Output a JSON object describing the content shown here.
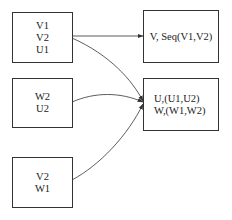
{
  "diagram": {
    "nodes": [
      {
        "id": "a",
        "lines": [
          "V1",
          "V2",
          "U1"
        ]
      },
      {
        "id": "b",
        "lines": [
          "W2",
          "U2"
        ]
      },
      {
        "id": "c",
        "lines": [
          "V2",
          "W1"
        ]
      },
      {
        "id": "d",
        "lines": [
          "V, Seq(V1,V2)"
        ]
      },
      {
        "id": "e",
        "lines": [
          "U,(U1,U2)",
          "W,(W1,W2)"
        ]
      }
    ],
    "edges": [
      {
        "from": "a",
        "to": "d"
      },
      {
        "from": "a",
        "to": "e"
      },
      {
        "from": "b",
        "to": "e"
      },
      {
        "from": "c",
        "to": "e"
      }
    ],
    "colors": {
      "stroke": "#333333",
      "background": "#ffffff"
    }
  }
}
